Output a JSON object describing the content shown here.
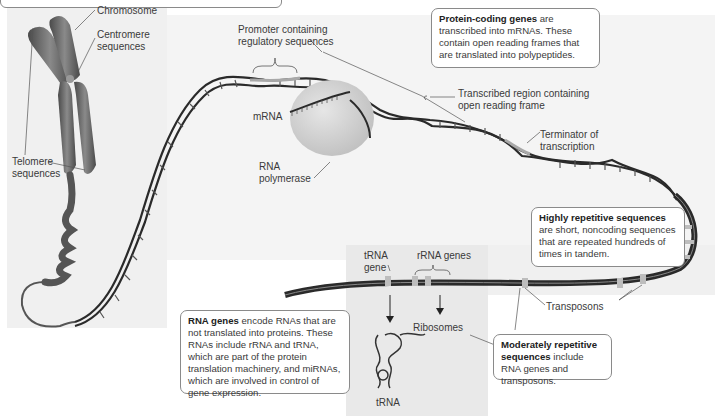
{
  "labels": {
    "chromosome": "Chromosome",
    "centromere": "Centromere\nsequences",
    "telomere": "Telomere\nsequences",
    "promoter": "Promoter containing\nregulatory sequences",
    "mrna": "mRNA",
    "rna_polymerase": "RNA\npolymerase",
    "transcribed_region": "Transcribed region containing\nopen reading frame",
    "terminator": "Terminator of\ntranscription",
    "trna_gene": "tRNA\ngene",
    "rrna_genes": "rRNA genes",
    "ribosomes": "Ribosomes",
    "trna": "tRNA",
    "transposons": "Transposons"
  },
  "callouts": {
    "protein_coding": {
      "bold": "Protein-coding genes",
      "text": " are transcribed into mRNAs. These contain open reading frames that are translated into polypeptides."
    },
    "highly_repetitive": {
      "bold": "Highly repetitive sequences",
      "text": " are short, noncoding sequences that are repeated hundreds of times in tandem."
    },
    "rna_genes": {
      "bold": "RNA genes",
      "text": " encode RNAs that are not translated into proteins. These RNAs include rRNA and tRNA, which are part of the protein translation machinery, and miRNAs, which are involved in control of gene expression."
    },
    "moderately_repetitive": {
      "bold": "Moderately repetitive sequences",
      "text": " include RNA genes and transposons."
    }
  },
  "colors": {
    "panel_bg": "#f0f0f0",
    "dna_dark": "#2a2a2a",
    "dna_light": "#a8a8a8",
    "chromosome": "#6e6e6e",
    "polymerase": "#d6d6d6",
    "callout_border": "#8a8a8a"
  }
}
